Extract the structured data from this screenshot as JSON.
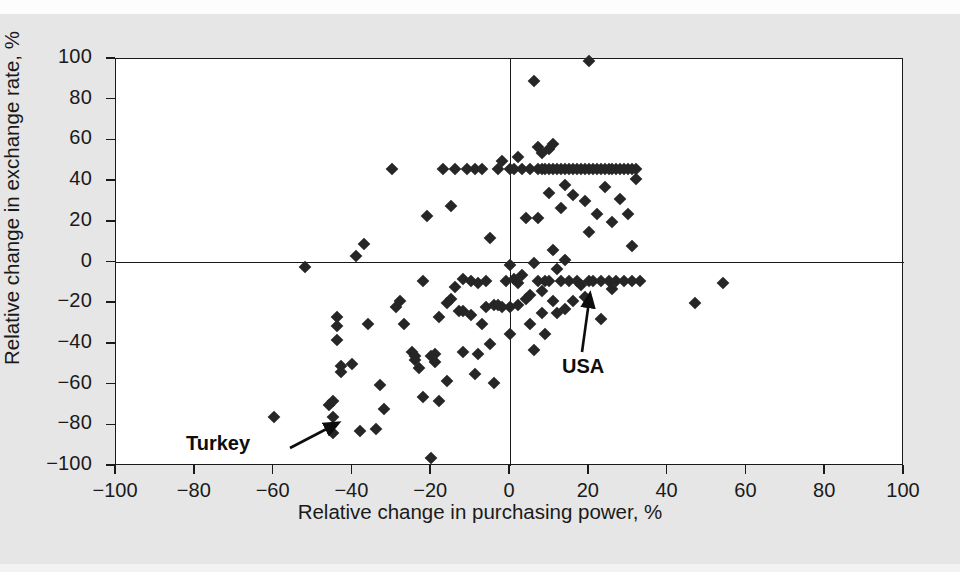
{
  "chart_data": {
    "type": "scatter",
    "title": "",
    "xlabel": "Relative change in purchasing power, %",
    "ylabel": "Relative change in exchange rate, %",
    "xlim": [
      -100,
      100
    ],
    "ylim": [
      -100,
      100
    ],
    "xticks": [
      -100,
      -80,
      -60,
      -40,
      -20,
      0,
      20,
      40,
      60,
      80,
      100
    ],
    "yticks": [
      -100,
      -80,
      -60,
      -40,
      -20,
      0,
      20,
      40,
      60,
      80,
      100
    ],
    "xtick_labels": [
      "−100",
      "−80",
      "−60",
      "−40",
      "−20",
      "0",
      "20",
      "40",
      "60",
      "80",
      "100"
    ],
    "ytick_labels": [
      "−100",
      "−80",
      "−60",
      "−40",
      "−20",
      "0",
      "20",
      "40",
      "60",
      "80",
      "100"
    ],
    "grid": false,
    "legend": null,
    "marker": "diamond",
    "marker_color": "#262626",
    "reference_lines": [
      {
        "axis": "y",
        "value": 0
      },
      {
        "axis": "x",
        "value": 0
      }
    ],
    "annotations": [
      {
        "label": "Turkey",
        "label_x": -78,
        "label_y": -90,
        "point_x": -46,
        "point_y": -82
      },
      {
        "label": "USA",
        "label_x": 9,
        "label_y": -48,
        "point_x": 18,
        "point_y": -11
      }
    ],
    "points": [
      [
        -60,
        -76
      ],
      [
        -52,
        -2
      ],
      [
        -46,
        -70
      ],
      [
        -45,
        -68
      ],
      [
        -45,
        -76
      ],
      [
        -45,
        -84
      ],
      [
        -44,
        -27
      ],
      [
        -44,
        -31
      ],
      [
        -44,
        -38
      ],
      [
        -43,
        -51
      ],
      [
        -43,
        -54
      ],
      [
        -40,
        -50
      ],
      [
        -39,
        3
      ],
      [
        -38,
        -83
      ],
      [
        -37,
        9
      ],
      [
        -36,
        -30
      ],
      [
        -34,
        -82
      ],
      [
        -33,
        -60
      ],
      [
        -32,
        -72
      ],
      [
        -30,
        46
      ],
      [
        -29,
        -22
      ],
      [
        -28,
        -19
      ],
      [
        -27,
        -30
      ],
      [
        -25,
        -44
      ],
      [
        -24,
        -48
      ],
      [
        -24,
        -46
      ],
      [
        -23,
        -52
      ],
      [
        -22,
        -66
      ],
      [
        -22,
        -9
      ],
      [
        -21,
        23
      ],
      [
        -20,
        -96
      ],
      [
        -20,
        -46
      ],
      [
        -19,
        -49
      ],
      [
        -19,
        -45
      ],
      [
        -18,
        -27
      ],
      [
        -18,
        -68
      ],
      [
        -17,
        46
      ],
      [
        -16,
        -58
      ],
      [
        -16,
        -20
      ],
      [
        -15,
        28
      ],
      [
        -15,
        -18
      ],
      [
        -14,
        46
      ],
      [
        -14,
        -12
      ],
      [
        -13,
        -24
      ],
      [
        -12,
        -24
      ],
      [
        -12,
        -44
      ],
      [
        -12,
        -8
      ],
      [
        -11,
        46
      ],
      [
        -10,
        -26
      ],
      [
        -10,
        -9
      ],
      [
        -9,
        46
      ],
      [
        -9,
        -55
      ],
      [
        -8,
        -45
      ],
      [
        -8,
        -10
      ],
      [
        -7,
        46
      ],
      [
        -7,
        -30
      ],
      [
        -6,
        -9
      ],
      [
        -6,
        -22
      ],
      [
        -5,
        12
      ],
      [
        -5,
        -40
      ],
      [
        -4,
        -59
      ],
      [
        -4,
        -21
      ],
      [
        -3,
        46
      ],
      [
        -3,
        -21
      ],
      [
        -2,
        50
      ],
      [
        -2,
        -22
      ],
      [
        -1,
        -9
      ],
      [
        0,
        46
      ],
      [
        0,
        -1
      ],
      [
        0,
        -22
      ],
      [
        0,
        -35
      ],
      [
        1,
        -8
      ],
      [
        1,
        46
      ],
      [
        2,
        52
      ],
      [
        2,
        -10
      ],
      [
        2,
        -21
      ],
      [
        3,
        46
      ],
      [
        3,
        -6
      ],
      [
        4,
        -18
      ],
      [
        4,
        22
      ],
      [
        5,
        46
      ],
      [
        5,
        -16
      ],
      [
        5,
        -30
      ],
      [
        6,
        89
      ],
      [
        6,
        -43
      ],
      [
        6,
        0
      ],
      [
        7,
        46
      ],
      [
        7,
        57
      ],
      [
        7,
        22
      ],
      [
        7,
        -9
      ],
      [
        8,
        46
      ],
      [
        8,
        54
      ],
      [
        8,
        -25
      ],
      [
        8,
        -14
      ],
      [
        9,
        46
      ],
      [
        9,
        -9
      ],
      [
        9,
        -35
      ],
      [
        10,
        46
      ],
      [
        10,
        34
      ],
      [
        10,
        56
      ],
      [
        10,
        -9
      ],
      [
        11,
        46
      ],
      [
        11,
        58
      ],
      [
        11,
        -19
      ],
      [
        11,
        6
      ],
      [
        12,
        46
      ],
      [
        12,
        -3
      ],
      [
        12,
        -25
      ],
      [
        13,
        46
      ],
      [
        13,
        27
      ],
      [
        13,
        -9
      ],
      [
        14,
        46
      ],
      [
        14,
        38
      ],
      [
        14,
        -23
      ],
      [
        14,
        1
      ],
      [
        15,
        46
      ],
      [
        15,
        -9
      ],
      [
        16,
        46
      ],
      [
        16,
        33
      ],
      [
        16,
        -19
      ],
      [
        17,
        46
      ],
      [
        17,
        -9
      ],
      [
        18,
        46
      ],
      [
        18,
        -11
      ],
      [
        19,
        46
      ],
      [
        19,
        30
      ],
      [
        19,
        -17
      ],
      [
        20,
        99
      ],
      [
        20,
        46
      ],
      [
        20,
        -9
      ],
      [
        20,
        15
      ],
      [
        21,
        46
      ],
      [
        21,
        -9
      ],
      [
        22,
        46
      ],
      [
        22,
        24
      ],
      [
        23,
        46
      ],
      [
        23,
        -9
      ],
      [
        23,
        -28
      ],
      [
        24,
        46
      ],
      [
        24,
        37
      ],
      [
        25,
        46
      ],
      [
        25,
        -9
      ],
      [
        26,
        46
      ],
      [
        26,
        20
      ],
      [
        26,
        -13
      ],
      [
        27,
        46
      ],
      [
        27,
        -9
      ],
      [
        28,
        46
      ],
      [
        28,
        31
      ],
      [
        29,
        46
      ],
      [
        29,
        -9
      ],
      [
        30,
        46
      ],
      [
        30,
        24
      ],
      [
        31,
        46
      ],
      [
        31,
        8
      ],
      [
        31,
        -9
      ],
      [
        32,
        46
      ],
      [
        32,
        41
      ],
      [
        33,
        -9
      ],
      [
        47,
        -20
      ],
      [
        54,
        -10
      ]
    ]
  }
}
